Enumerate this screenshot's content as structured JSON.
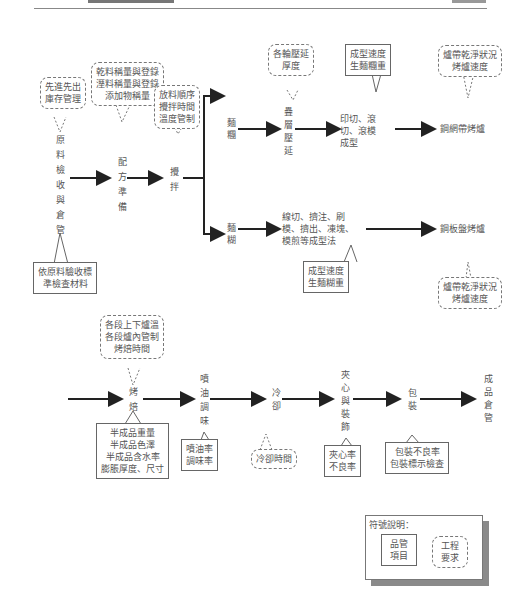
{
  "header": {
    "title": "",
    "page": ""
  },
  "flow_row1": {
    "nodes": {
      "raw_material": [
        "原",
        "料",
        "檢",
        "收",
        "與",
        "倉",
        "管"
      ],
      "formula_prep": [
        "配",
        "方",
        "準",
        "備"
      ],
      "mixing": [
        "攪",
        "拌"
      ],
      "dough_branch": [
        "麵",
        "糰"
      ],
      "batter_branch": [
        "麵",
        "糊"
      ],
      "laminate": [
        "疊",
        "層",
        "壓",
        "延"
      ],
      "shape_cut": "印切、滾切、滾模成型",
      "shape_batter": "線切、擠注、刷模、擠出、凍塊、模煎等成型法",
      "oven_mesh": "鋼網帶烤爐",
      "oven_plate": "鋼板盤烤爐"
    },
    "eng_notes": {
      "fifo": [
        "先進先出",
        "庫存管理"
      ],
      "weighing": [
        "乾料稱量與登錄",
        "溼料稱量與登錄",
        "添加物稱量"
      ],
      "mix_ctrl": [
        "放料順序",
        "攪拌時間",
        "溫度管制"
      ],
      "roll_thick": [
        "各輪壓延",
        "厚度"
      ],
      "belt_mesh": [
        "爐帶乾淨狀況",
        "烤爐速度"
      ],
      "belt_plate": [
        "爐帶乾淨狀況",
        "烤爐速度"
      ]
    },
    "qc_notes": {
      "raw_check": [
        "依原料驗收標",
        "準檢查材料"
      ],
      "speed_dough": [
        "成型速度",
        "生麵糰重"
      ],
      "speed_batter": [
        "成型速度",
        "生麵糊重"
      ]
    }
  },
  "flow_row2": {
    "nodes": {
      "bake": [
        "烤",
        "焙"
      ],
      "oil_season": [
        "噴",
        "油",
        "調",
        "味"
      ],
      "cool": [
        "冷",
        "卻"
      ],
      "sandwich": [
        "夾",
        "心",
        "與",
        "裝",
        "飾"
      ],
      "pack": [
        "包",
        "裝"
      ],
      "finished": [
        "成",
        "品",
        "倉",
        "管"
      ]
    },
    "eng_notes": {
      "oven_ctrl": [
        "各段上下爐溫",
        "各段爐內管制",
        "烤焙時間"
      ],
      "cool_time": [
        "冷卻時間"
      ]
    },
    "qc_notes": {
      "semi": [
        "半成品重量",
        "半成品色澤",
        "半成品含水率",
        "膨脹厚度、尺寸"
      ],
      "oil": [
        "噴油率",
        "調味率"
      ],
      "sand": [
        "夾心率",
        "不良率"
      ],
      "pack": [
        "包裝不良率",
        "包裝標示檢查"
      ]
    }
  },
  "legend": {
    "title": "符號說明：",
    "qc_item": [
      "品管",
      "項目"
    ],
    "eng_req": [
      "工程",
      "要求"
    ]
  },
  "colors": {
    "line": "#222222",
    "text": "#555555",
    "shadow": "#8a8a8a"
  }
}
